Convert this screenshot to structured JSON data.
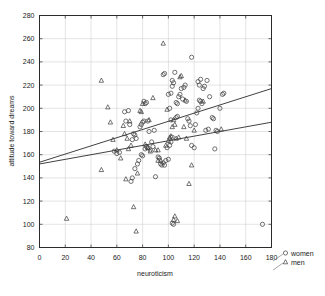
{
  "chart_data": {
    "type": "scatter",
    "title": "",
    "xlabel": "neuroticism",
    "ylabel": "attitude toward dreams",
    "xlim": [
      0,
      180
    ],
    "ylim": [
      80,
      280
    ],
    "xticks": [
      0,
      20,
      40,
      60,
      80,
      100,
      120,
      140,
      160,
      180
    ],
    "yticks": [
      80,
      100,
      120,
      140,
      160,
      180,
      200,
      220,
      240,
      260,
      280
    ],
    "grid": true,
    "legend_position": "outside-bottom-right",
    "legend": [
      {
        "name": "women",
        "marker": "circle"
      },
      {
        "name": "men",
        "marker": "triangle"
      }
    ],
    "series": [
      {
        "name": "women",
        "marker": "circle",
        "points": [
          [
            66,
            197
          ],
          [
            69,
            198
          ],
          [
            67,
            189
          ],
          [
            70,
            186
          ],
          [
            73,
            178
          ],
          [
            74,
            177
          ],
          [
            75,
            174
          ],
          [
            72,
            173
          ],
          [
            78,
            184
          ],
          [
            79,
            186
          ],
          [
            80,
            188
          ],
          [
            81,
            189
          ],
          [
            82,
            204
          ],
          [
            83,
            205
          ],
          [
            81,
            206
          ],
          [
            84,
            189
          ],
          [
            85,
            180
          ],
          [
            87,
            171
          ],
          [
            89,
            181
          ],
          [
            88,
            167
          ],
          [
            86,
            164
          ],
          [
            84,
            166
          ],
          [
            83,
            167
          ],
          [
            82,
            165
          ],
          [
            80,
            159
          ],
          [
            79,
            160
          ],
          [
            77,
            155
          ],
          [
            76,
            152
          ],
          [
            74,
            148
          ],
          [
            72,
            140
          ],
          [
            71,
            137
          ],
          [
            90,
            141
          ],
          [
            92,
            158
          ],
          [
            93,
            157
          ],
          [
            94,
            152
          ],
          [
            95,
            151
          ],
          [
            96,
            153
          ],
          [
            97,
            151
          ],
          [
            98,
            155
          ],
          [
            100,
            156
          ],
          [
            99,
            166
          ],
          [
            101,
            168
          ],
          [
            102,
            171
          ],
          [
            103,
            175
          ],
          [
            102,
            190
          ],
          [
            101,
            200
          ],
          [
            100,
            212
          ],
          [
            102,
            213
          ],
          [
            103,
            219
          ],
          [
            104,
            222
          ],
          [
            103,
            224
          ],
          [
            105,
            231
          ],
          [
            97,
            230
          ],
          [
            96,
            229
          ],
          [
            106,
            205
          ],
          [
            107,
            204
          ],
          [
            108,
            210
          ],
          [
            109,
            212
          ],
          [
            110,
            217
          ],
          [
            112,
            218
          ],
          [
            113,
            220
          ],
          [
            111,
            208
          ],
          [
            114,
            206
          ],
          [
            115,
            191
          ],
          [
            116,
            189
          ],
          [
            117,
            185
          ],
          [
            118,
            168
          ],
          [
            120,
            166
          ],
          [
            121,
            186
          ],
          [
            122,
            196
          ],
          [
            123,
            200
          ],
          [
            124,
            207
          ],
          [
            125,
            206
          ],
          [
            126,
            204
          ],
          [
            124,
            220
          ],
          [
            125,
            225
          ],
          [
            123,
            223
          ],
          [
            127,
            217
          ],
          [
            128,
            219
          ],
          [
            130,
            224
          ],
          [
            132,
            210
          ],
          [
            134,
            192
          ],
          [
            135,
            191
          ],
          [
            136,
            165
          ],
          [
            137,
            181
          ],
          [
            138,
            180
          ],
          [
            140,
            200
          ],
          [
            142,
            212
          ],
          [
            143,
            213
          ],
          [
            118,
            244
          ],
          [
            104,
            100
          ],
          [
            103,
            101
          ],
          [
            173,
            100
          ],
          [
            60,
            161
          ],
          [
            58,
            163
          ],
          [
            62,
            162
          ],
          [
            129,
            181
          ],
          [
            131,
            182
          ],
          [
            106,
            192
          ],
          [
            107,
            193
          ]
        ]
      },
      {
        "name": "men",
        "marker": "triangle",
        "points": [
          [
            21,
            105
          ],
          [
            48,
            224
          ],
          [
            48,
            147
          ],
          [
            53,
            201
          ],
          [
            55,
            188
          ],
          [
            57,
            173
          ],
          [
            60,
            164
          ],
          [
            63,
            157
          ],
          [
            65,
            185
          ],
          [
            66,
            178
          ],
          [
            68,
            174
          ],
          [
            67,
            139
          ],
          [
            69,
            165
          ],
          [
            71,
            168
          ],
          [
            73,
            115
          ],
          [
            75,
            94
          ],
          [
            76,
            144
          ],
          [
            78,
            198
          ],
          [
            79,
            197
          ],
          [
            80,
            204
          ],
          [
            82,
            169
          ],
          [
            84,
            166
          ],
          [
            86,
            163
          ],
          [
            88,
            209
          ],
          [
            90,
            164
          ],
          [
            92,
            155
          ],
          [
            94,
            155
          ],
          [
            96,
            256
          ],
          [
            98,
            168
          ],
          [
            100,
            172
          ],
          [
            101,
            175
          ],
          [
            102,
            176
          ],
          [
            103,
            184
          ],
          [
            104,
            190
          ],
          [
            105,
            186
          ],
          [
            106,
            174
          ],
          [
            108,
            175
          ],
          [
            110,
            228
          ],
          [
            109,
            227
          ],
          [
            112,
            184
          ],
          [
            114,
            174
          ],
          [
            116,
            135
          ],
          [
            118,
            151
          ],
          [
            120,
            181
          ],
          [
            105,
            107
          ],
          [
            107,
            103
          ],
          [
            104,
            104
          ],
          [
            141,
            182
          ],
          [
            127,
            206
          ],
          [
            113,
            207
          ],
          [
            99,
            199
          ],
          [
            92,
            164
          ],
          [
            85,
            190
          ],
          [
            70,
            189
          ]
        ]
      }
    ],
    "fit_lines": [
      {
        "series": "women",
        "x0": 0,
        "y0": 153.5,
        "x1": 180,
        "y1": 217.0
      },
      {
        "series": "men",
        "x0": 0,
        "y0": 152.0,
        "x1": 180,
        "y1": 188.0
      }
    ]
  }
}
